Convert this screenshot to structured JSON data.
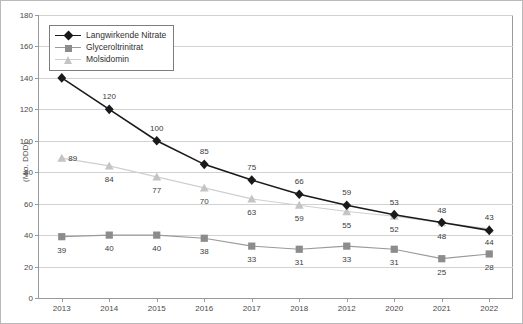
{
  "chart_data": {
    "type": "line",
    "title": "",
    "xlabel": "",
    "ylabel": "(Mio. DDD)",
    "ylim": [
      0,
      180
    ],
    "ytick_step": 20,
    "yticks": [
      "0",
      "20",
      "40",
      "60",
      "80",
      "100",
      "120",
      "140",
      "160",
      "180"
    ],
    "categories": [
      "2013",
      "2014",
      "2015",
      "2016",
      "2017",
      "2018",
      "2012",
      "2020",
      "2021",
      "2022"
    ],
    "grid": "horizontal",
    "legend_position": "top-left",
    "series": [
      {
        "name": "Langwirkende Nitrate",
        "color": "#1a1a1a",
        "marker": "diamond",
        "values": [
          140,
          120,
          100,
          85,
          75,
          66,
          59,
          53,
          48,
          43
        ]
      },
      {
        "name": "Glyceroltrinitrat",
        "color": "#8c8c8c",
        "marker": "square",
        "values": [
          39,
          40,
          40,
          38,
          33,
          31,
          33,
          31,
          25,
          28
        ]
      },
      {
        "name": "Molsidomin",
        "color": "#c4c4c4",
        "marker": "triangle",
        "values": [
          89,
          84,
          77,
          70,
          63,
          59,
          55,
          52,
          48,
          44
        ]
      }
    ],
    "point_labels": {
      "langwirkende_nitrate": [
        "140",
        "120",
        "100",
        "85",
        "75",
        "66",
        "59",
        "53",
        "48",
        "43"
      ],
      "glyceroltrinitrat": [
        "39",
        "40",
        "40",
        "38",
        "33",
        "31",
        "33",
        "31",
        "25",
        "28"
      ],
      "molsidomin": [
        "89",
        "84",
        "77",
        "70",
        "63",
        "59",
        "55",
        "52",
        "48",
        "44"
      ]
    }
  },
  "legend": {
    "items": [
      {
        "label": "Langwirkende Nitrate"
      },
      {
        "label": "Glyceroltrinitrat"
      },
      {
        "label": "Molsidomin"
      }
    ]
  },
  "axes": {
    "y_title": "(Mio. DDD)"
  }
}
